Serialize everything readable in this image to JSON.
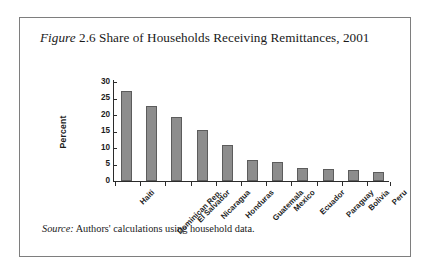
{
  "figure": {
    "label_italic": "Figure",
    "number": "2.6",
    "title_rest": "Share of Households Receiving Remittances, 2001",
    "title_full": "Figure 2.6 Share of Households Receiving Remittances, 2001",
    "source_italic": "Source:",
    "source_text": "Authors' calculations using household data.",
    "frame_color": "#7e7e7e",
    "background_color": "#ffffff"
  },
  "chart_data": {
    "type": "bar",
    "title": "Figure 2.6 Share of Households Receiving Remittances, 2001",
    "xlabel": "",
    "ylabel": "Percent",
    "categories": [
      "Haiti",
      "Dominican Rep.",
      "El Salvador",
      "Nicaragua",
      "Honduras",
      "Guatemala",
      "Mexico",
      "Ecuador",
      "Paraguay",
      "Bolivia",
      "Peru"
    ],
    "values": [
      27.3,
      22.8,
      19.3,
      15.5,
      10.8,
      6.5,
      5.7,
      3.8,
      3.6,
      3.2,
      2.6
    ],
    "ylim": [
      0,
      30
    ],
    "yticks": [
      0,
      5,
      10,
      15,
      20,
      25,
      30
    ],
    "ytick_labels": [
      "0",
      "5",
      "10",
      "15",
      "20",
      "25",
      "30"
    ],
    "grid": false,
    "legend": "none",
    "bar_color": "#8d8d8d",
    "bar_edge_color": "#5c5c5c",
    "axis_color": "#2b2b2b",
    "xtick_label_rotation": -45
  }
}
